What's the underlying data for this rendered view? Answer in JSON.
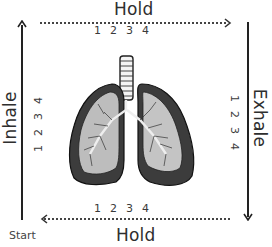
{
  "diagram": {
    "title_type": "box-breathing",
    "top": {
      "label": "Hold",
      "counts": [
        "1",
        "2",
        "3",
        "4"
      ],
      "direction": "right"
    },
    "right": {
      "label": "Exhale",
      "counts": [
        "1",
        "2",
        "3",
        "4"
      ],
      "direction": "down"
    },
    "bottom": {
      "label": "Hold",
      "counts": [
        "1",
        "2",
        "3",
        "4"
      ],
      "direction": "left"
    },
    "left": {
      "label": "Inhale",
      "counts": [
        "1",
        "2",
        "3",
        "4"
      ],
      "direction": "up"
    },
    "start_label": "Start",
    "center_image": "lungs-illustration",
    "colors": {
      "line": "#222222",
      "text": "#2e2e2e",
      "background": "#ffffff"
    }
  }
}
